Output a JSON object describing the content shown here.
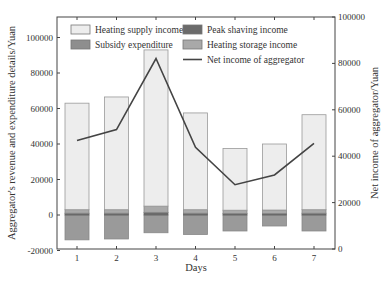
{
  "chart_data": {
    "type": "bar",
    "subtype": "stacked bar with line on secondary axis",
    "categories": [
      "1",
      "2",
      "3",
      "4",
      "5",
      "6",
      "7"
    ],
    "xlabel": "Days",
    "ylabel": "Aggregator's revenue and expenditure details/Yuan",
    "y2label": "Net income of aggregator/Yuan",
    "ylim": [
      -20000,
      110000
    ],
    "y2lim": [
      0,
      100000
    ],
    "yticks": [
      -20000,
      0,
      20000,
      40000,
      60000,
      80000,
      100000
    ],
    "y2ticks": [
      0,
      20000,
      40000,
      60000,
      80000,
      100000
    ],
    "grid": false,
    "legend_position": "upper left inside",
    "series": [
      {
        "name": "Heating supply income",
        "type": "bar",
        "axis": "left",
        "color": "#ededed",
        "values": [
          60000,
          63500,
          88000,
          54500,
          34800,
          37200,
          53500
        ]
      },
      {
        "name": "Peak shaving income",
        "type": "bar",
        "axis": "left",
        "color": "#6b6b6b",
        "values": [
          1000,
          1000,
          1500,
          1000,
          900,
          900,
          1000
        ]
      },
      {
        "name": "Subsidy expenditure",
        "type": "bar",
        "axis": "left",
        "color": "#9a9a9a",
        "values": [
          -14000,
          -13500,
          -10000,
          -11000,
          -9000,
          -6200,
          -9000
        ]
      },
      {
        "name": "Heating storage income",
        "type": "bar",
        "axis": "left",
        "color": "#a9a9a9",
        "values": [
          2000,
          2000,
          3500,
          2000,
          1800,
          1900,
          2000
        ]
      },
      {
        "name": "Net income of aggregator",
        "type": "line",
        "axis": "right",
        "color": "#444444",
        "values": [
          46800,
          51500,
          82100,
          43800,
          27700,
          31900,
          45500
        ]
      }
    ],
    "bar_totals_positive": [
      63000,
      66500,
      93000,
      57500,
      37500,
      40000,
      56500
    ]
  },
  "legend": {
    "items": [
      {
        "label": "Heating supply income",
        "color": "#ededed",
        "kind": "box"
      },
      {
        "label": "Peak shaving income",
        "color": "#6b6b6b",
        "kind": "box"
      },
      {
        "label": "Subsidy expenditure",
        "color": "#8e8e8e",
        "kind": "box"
      },
      {
        "label": "Heating storage income",
        "color": "#a9a9a9",
        "kind": "box"
      },
      {
        "label": "Net income of aggregator",
        "color": "#444444",
        "kind": "line"
      }
    ]
  }
}
